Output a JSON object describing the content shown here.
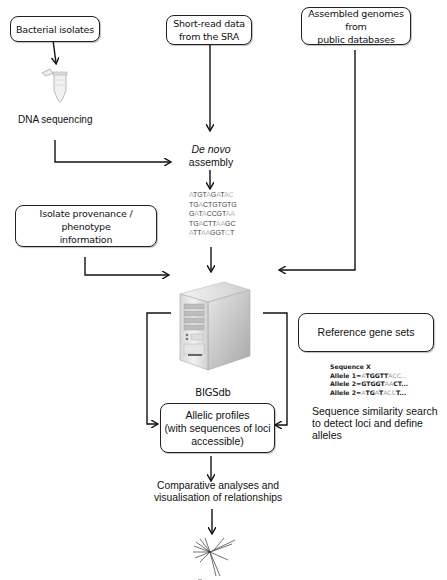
{
  "boxes": {
    "bacterial_isolates": "Bacterial isolates",
    "short_read": [
      "Short-read data",
      "from the SRA"
    ],
    "assembled_genomes": [
      "Assembled genomes from",
      "public databases"
    ],
    "isolate_provenance": [
      "Isolate provenance / phenotype",
      "information"
    ],
    "reference_gene_sets": "Reference gene sets",
    "allelic_profiles": [
      "Allelic profiles",
      "(with sequences of loci",
      "accessible)"
    ]
  },
  "labels": {
    "dna_sequencing": "DNA sequencing",
    "de_novo": "De novo",
    "assembly": "assembly",
    "bigsdb": "BIGSdb",
    "similarity_search": [
      "Sequence similarity search",
      "to detect loci and define",
      "alleles"
    ],
    "comparative": [
      "Comparative analyses and",
      "visualisation of relationships"
    ]
  },
  "assembly_sequences": [
    [
      [
        "l",
        "A"
      ],
      [
        "d",
        "TGT"
      ],
      [
        "l",
        "A"
      ],
      [
        "d",
        "G"
      ],
      [
        "l",
        "A"
      ],
      [
        "d",
        "T"
      ],
      [
        "l",
        "AC"
      ]
    ],
    [
      [
        "d",
        "TG"
      ],
      [
        "l",
        "A"
      ],
      [
        "d",
        "CTGTGTG"
      ]
    ],
    [
      [
        "d",
        "G"
      ],
      [
        "l",
        "A"
      ],
      [
        "d",
        "T"
      ],
      [
        "l",
        "A"
      ],
      [
        "d",
        "CCGT"
      ],
      [
        "l",
        "AA"
      ]
    ],
    [
      [
        "d",
        "TG"
      ],
      [
        "l",
        "A"
      ],
      [
        "d",
        "CTT"
      ],
      [
        "l",
        "AA"
      ],
      [
        "d",
        "GC"
      ]
    ],
    [
      [
        "l",
        "A"
      ],
      [
        "d",
        "TT"
      ],
      [
        "l",
        "AA"
      ],
      [
        "d",
        "GGT"
      ],
      [
        "l",
        "C"
      ],
      [
        "d",
        "T"
      ]
    ]
  ],
  "allele_example": {
    "title": "Sequence X",
    "rows": [
      {
        "prefix": "Allele 1=",
        "seq": [
          [
            "g",
            "A"
          ],
          [
            "b",
            "TGGTT"
          ],
          [
            "g",
            "ACC..."
          ]
        ]
      },
      {
        "prefix": "Allele 2=",
        "seq": [
          [
            "b",
            "GTGGT"
          ],
          [
            "g",
            "AA"
          ],
          [
            "b",
            "CT..."
          ]
        ]
      },
      {
        "prefix": "Allele 2=",
        "seq": [
          [
            "g",
            "A"
          ],
          [
            "b",
            "TG"
          ],
          [
            "g",
            "A"
          ],
          [
            "b",
            "T"
          ],
          [
            "g",
            "ACC"
          ],
          [
            "b",
            "T..."
          ]
        ]
      }
    ]
  },
  "icons": {
    "tube": "microcentrifuge-tube-icon",
    "server": "database-server-icon",
    "tree": "phylogenetic-tree-icon"
  },
  "colors": {
    "line": "#111111",
    "server_light": "#e8e8e8",
    "server_mid": "#c4c4c4",
    "server_dark": "#9a9a9a",
    "faded_base": "#bbbbbb"
  }
}
